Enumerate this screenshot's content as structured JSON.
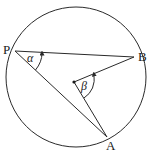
{
  "diagram": {
    "type": "circle-geometry",
    "colors": {
      "stroke": "#2a2a2a",
      "background": "#ffffff"
    },
    "circle": {
      "cx": 76,
      "cy": 77,
      "r": 70
    },
    "points": {
      "P": {
        "label": "P",
        "x": 15,
        "y": 51
      },
      "B": {
        "label": "B",
        "x": 134,
        "y": 57
      },
      "A": {
        "label": "A",
        "x": 107,
        "y": 137
      },
      "O": {
        "label": "",
        "x": 74,
        "y": 82
      }
    },
    "angles": {
      "alpha": {
        "label": "α",
        "vertex": "P"
      },
      "beta": {
        "label": "β",
        "vertex": "O"
      }
    },
    "segments": [
      [
        "P",
        "B"
      ],
      [
        "P",
        "A"
      ],
      [
        "O",
        "B"
      ],
      [
        "O",
        "A"
      ]
    ]
  }
}
